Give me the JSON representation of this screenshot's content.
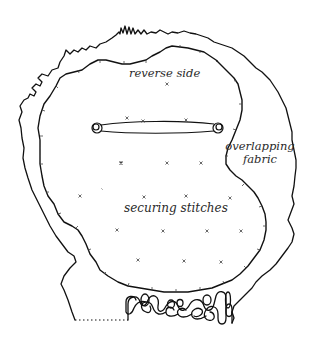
{
  "diagram": {
    "type": "fabric-patch-illustration",
    "labels": {
      "reverse_side": "reverse side",
      "overlapping_fabric_line1": "overlapping",
      "overlapping_fabric_line2": "fabric",
      "securing_stitches": "securing stitches"
    },
    "elements": {
      "outer_edge": "frayed overlapping fabric outline",
      "inner_edge": "stitched inner patch outline (reverse side)",
      "bar_tack": "buttonhole bar with round eyelets at both ends",
      "stitch_marks": "small cross securing stitches scattered in grid",
      "bottom_loops": "looped/curled fabric edge along bottom",
      "dotted_edge": "dotted cut line at bottom left"
    },
    "stitch_marks": [
      [
        167,
        84
      ],
      [
        127,
        118
      ],
      [
        143,
        121
      ],
      [
        186,
        120
      ],
      [
        121,
        163
      ],
      [
        167,
        163
      ],
      [
        201,
        163
      ],
      [
        80,
        196
      ],
      [
        102,
        189
      ],
      [
        144,
        197
      ],
      [
        186,
        196
      ],
      [
        230,
        198
      ],
      [
        117,
        230
      ],
      [
        163,
        231
      ],
      [
        207,
        231
      ],
      [
        241,
        231
      ],
      [
        138,
        260
      ],
      [
        184,
        261
      ],
      [
        221,
        262
      ]
    ],
    "colors": {
      "line": "#111111",
      "text": "#2a2a2a",
      "background": "#ffffff"
    }
  }
}
